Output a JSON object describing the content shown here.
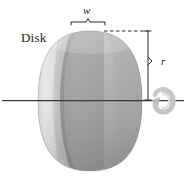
{
  "figure": {
    "kind": "technical-illustration",
    "background_color": "#ffffff",
    "line_color": "#2b2b2b",
    "labels": {
      "body": "Disk",
      "width": "w",
      "radius": "r"
    },
    "icons": {
      "rotation": "rotation-arrow-icon",
      "axis": "axis-line-icon",
      "width_brace": "width-brace-icon",
      "radius_dimension": "radius-dimension-icon",
      "dashed_leader": "dashed-leader-line-icon"
    },
    "colors": {
      "disk_light": "#d9d9d9",
      "disk_mid": "#b4b4b4",
      "disk_dark": "#9a9a9a",
      "disk_darker": "#8b8b8b",
      "disk_face": "#a8a8a8",
      "rotation_arrow": "#c9c9c9",
      "outline": "#2b2b2b"
    },
    "geometry": {
      "disk_left_x": 38,
      "disk_right_x": 142,
      "disk_top_y": 31,
      "disk_bottom_y": 171,
      "axis_y": 100,
      "axis_x_start": 2,
      "axis_x_end": 184,
      "brace_left_x": 71,
      "brace_right_x": 106,
      "brace_y": 24,
      "radius_line_x": 148,
      "radius_top_y": 31,
      "radius_bottom_y": 100,
      "dashed_from_x": 104,
      "dashed_to_x": 148,
      "dashed_y": 31
    }
  }
}
